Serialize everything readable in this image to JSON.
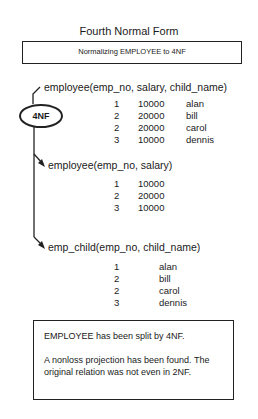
{
  "title": "Fourth Normal Form",
  "subtitle": "Normalizing EMPLOYEE to 4NF",
  "operation_label": "4NF",
  "source_relation": {
    "signature": "employee(emp_no, salary, child_name)",
    "rows": [
      [
        "1",
        "10000",
        "alan"
      ],
      [
        "2",
        "20000",
        "bill"
      ],
      [
        "2",
        "20000",
        "carol"
      ],
      [
        "3",
        "10000",
        "dennis"
      ]
    ]
  },
  "result_relations": [
    {
      "signature": "employee(emp_no, salary)",
      "rows": [
        [
          "1",
          "10000"
        ],
        [
          "2",
          "20000"
        ],
        [
          "3",
          "10000"
        ]
      ]
    },
    {
      "signature": "emp_child(emp_no,  child_name)",
      "rows": [
        [
          "1",
          "alan"
        ],
        [
          "2",
          "bill"
        ],
        [
          "2",
          "carol"
        ],
        [
          "3",
          "dennis"
        ]
      ]
    }
  ],
  "note": {
    "line1": "EMPLOYEE has been split by 4NF.",
    "line2": "A nonloss projection has been found. The original relation was not even in 2NF."
  }
}
